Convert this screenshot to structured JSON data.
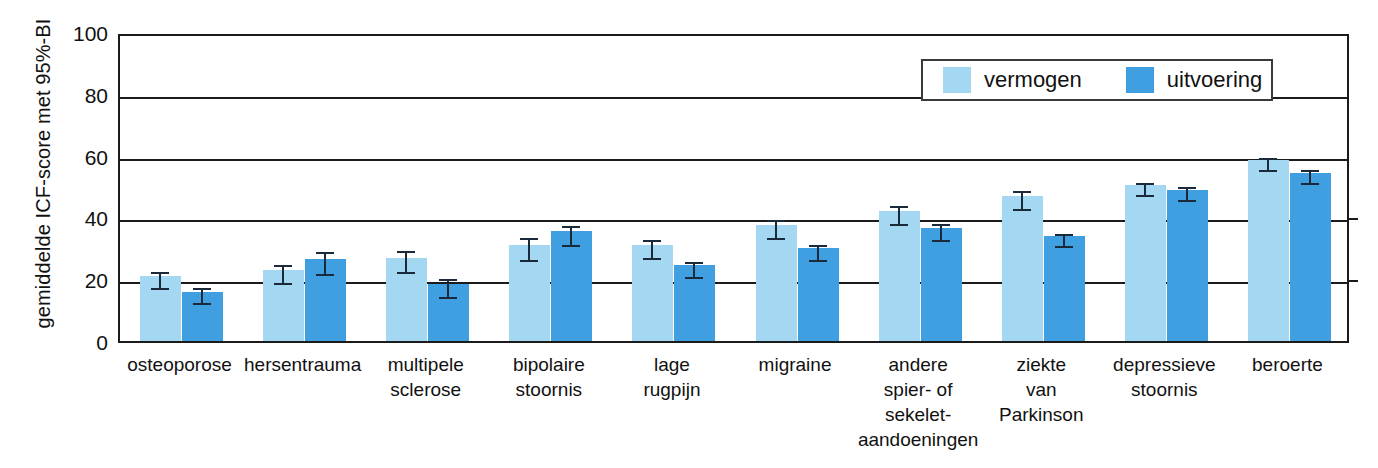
{
  "chart_data": {
    "type": "bar",
    "title": "",
    "xlabel": "",
    "ylabel": "gemiddelde ICF-score met 95%-BI",
    "ylim": [
      0,
      100
    ],
    "yticks": [
      0,
      20,
      40,
      60,
      80,
      100
    ],
    "grid": true,
    "legend_position": "top-right",
    "categories": [
      "osteoporose",
      "hersentrauma",
      "multipele sclerose",
      "bipolaire stoornis",
      "lage rugpijn",
      "migraine",
      "andere spier- of sekelet-aandoeningen",
      "ziekte van Parkinson",
      "depressieve stoornis",
      "beroerte"
    ],
    "category_lines": [
      [
        "osteoporose"
      ],
      [
        "hersentrauma"
      ],
      [
        "multipele",
        "sclerose"
      ],
      [
        "bipolaire",
        "stoornis"
      ],
      [
        "lage",
        "rugpijn"
      ],
      [
        "migraine"
      ],
      [
        "andere",
        "spier- of",
        "sekelet-",
        "aandoeningen"
      ],
      [
        "ziekte",
        "van",
        "Parkinson"
      ],
      [
        "depressieve",
        "stoornis"
      ],
      [
        "beroerte"
      ]
    ],
    "series": [
      {
        "name": "vermogen",
        "color": "#A4D8F2",
        "values": [
          21,
          23,
          27,
          31,
          31,
          37.5,
          42,
          47,
          50.5,
          58.5
        ],
        "errors": [
          2.5,
          3,
          3.5,
          3.5,
          3,
          3,
          3,
          3,
          2,
          2
        ]
      },
      {
        "name": "uitvoering",
        "color": "#3F9FE0",
        "values": [
          16,
          26.5,
          18.5,
          35.5,
          24.5,
          30,
          36.5,
          34,
          49,
          54.5
        ],
        "errors": [
          2.5,
          3.5,
          3,
          3,
          2.5,
          2.5,
          2.5,
          2,
          2,
          2
        ]
      }
    ]
  },
  "legend": {
    "entries": [
      {
        "label": "vermogen",
        "color": "#A4D8F2"
      },
      {
        "label": "uitvoering",
        "color": "#3F9FE0"
      }
    ]
  },
  "axis": {
    "y_label": "gemiddelde ICF-score met 95%-BI",
    "tick_labels": [
      "100",
      "80",
      "60",
      "40",
      "20",
      "0"
    ]
  },
  "colors": {
    "vermogen": "#A4D8F2",
    "uitvoering": "#3F9FE0",
    "axis": "#1b1b1b",
    "error_bar": "#1b2a3a",
    "background": "#ffffff"
  }
}
